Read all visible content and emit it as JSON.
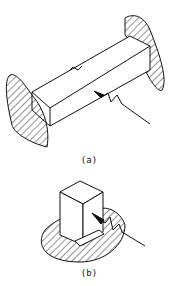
{
  "figure": {
    "panels": [
      {
        "id": "a",
        "label": "(a)",
        "description": "Beam fixed between two hatched supports with weld/crack arrow"
      },
      {
        "id": "b",
        "label": "(b)",
        "description": "Block on hatched base with weld/crack arrow"
      }
    ],
    "colors": {
      "line": "#111111",
      "background": "#ffffff"
    }
  }
}
